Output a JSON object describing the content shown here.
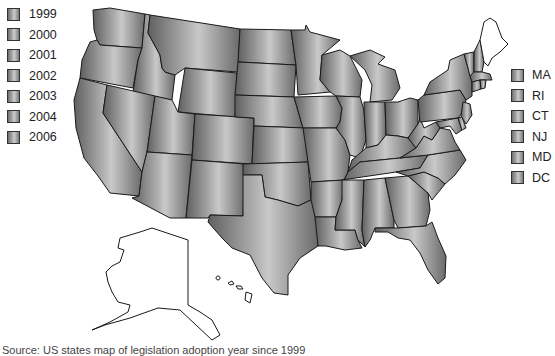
{
  "legend_years": {
    "items": [
      {
        "label": "1999"
      },
      {
        "label": "2000"
      },
      {
        "label": "2001"
      },
      {
        "label": "2002"
      },
      {
        "label": "2003"
      },
      {
        "label": "2004"
      },
      {
        "label": "2006"
      }
    ]
  },
  "legend_states": {
    "items": [
      {
        "label": "MA"
      },
      {
        "label": "RI"
      },
      {
        "label": "CT"
      },
      {
        "label": "NJ"
      },
      {
        "label": "MD"
      },
      {
        "label": "DC"
      }
    ]
  },
  "map": {
    "region": "United States",
    "shaded_fill": "gradient-gray",
    "unshaded_states": [
      "Maine",
      "Alaska",
      "Hawaii"
    ],
    "border_color": "#1a1a1a",
    "background": "#ffffff"
  },
  "caption": {
    "text": "Source: US states map of legislation adoption year since 1999"
  }
}
